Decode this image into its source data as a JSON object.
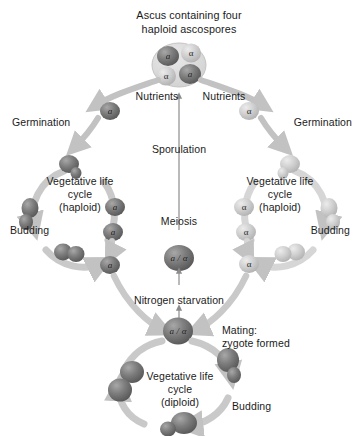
{
  "figure": {
    "title_line1": "Ascus containing four",
    "title_line2": "haploid ascospores"
  },
  "labels": {
    "nutrients_left": "Nutrients",
    "nutrients_right": "Nutrients",
    "germination_left": "Germination",
    "germination_right": "Germination",
    "sporulation": "Sporulation",
    "meiosis": "Meiosis",
    "nitrogen_starvation": "Nitrogen starvation",
    "mating_line1": "Mating:",
    "mating_line2": "zygote formed",
    "budding_left": "Budding",
    "budding_right": "Budding",
    "budding_bottom": "Budding"
  },
  "cycles": {
    "haploid_left": {
      "line1": "Vegetative life",
      "line2": "cycle",
      "line3": "(haploid)"
    },
    "haploid_right": {
      "line1": "Vegetative life",
      "line2": "cycle",
      "line3": "(haploid)"
    },
    "diploid_bottom": {
      "line1": "Vegetative life",
      "line2": "cycle",
      "line3": "(diploid)"
    }
  },
  "cells": {
    "ascospore_a_top": "a",
    "ascospore_alpha_top": "α",
    "ascospore_alpha_bottom": "α",
    "ascospore_a_bottom": "a",
    "germinating_a": "a",
    "germinating_alpha": "α",
    "left_cycle_a_upper": "a",
    "left_cycle_a_lower": "a",
    "left_exit_a": "a",
    "right_cycle_alpha_upper": "α",
    "right_cycle_alpha_lower": "α",
    "right_exit_alpha": "α",
    "diploid_meiosis": "a / α",
    "diploid_zygote": "a / α"
  },
  "colors": {
    "cell_dark": "#6e6e6e",
    "cell_light": "#c9c9c9",
    "arrow_grey": "#c2c2c2",
    "arrow_thin": "#8c8c8c",
    "text": "#1b1b1b",
    "background": "#ffffff"
  }
}
